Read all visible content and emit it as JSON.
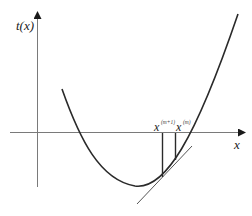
{
  "figure": {
    "top_strip_text": "",
    "y_axis_label": "t(x)",
    "x_axis_label": "x",
    "points": [
      {
        "base": "x",
        "superscript": "(m+1)"
      },
      {
        "base": "x",
        "superscript": "(m)"
      }
    ],
    "colors": {
      "axis": "#7a7a7a",
      "curve": "#2a2a2a",
      "tangent": "#555555",
      "label": "#222222"
    }
  }
}
